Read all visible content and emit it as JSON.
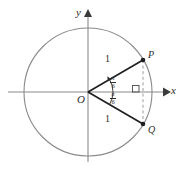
{
  "figure": {
    "type": "geometry-diagram",
    "axes": {
      "x_label": "x",
      "y_label": "y"
    },
    "origin_label": "O",
    "points": [
      {
        "name": "P",
        "label": "P",
        "position": "upper-right"
      },
      {
        "name": "Q",
        "label": "Q",
        "position": "lower-right"
      }
    ],
    "segment_lengths": [
      {
        "segment": "OP",
        "label": "1"
      },
      {
        "segment": "OQ",
        "label": "1"
      }
    ],
    "angles": [
      {
        "between": "OP-and-x-axis",
        "numerator": "π",
        "denominator": "6"
      },
      {
        "between": "OQ-and-x-axis",
        "numerator": "π",
        "denominator": "6"
      }
    ],
    "right_angle_marker": true,
    "colors": {
      "circle": "#8a8a8a",
      "axis": "#8a8a8a",
      "radius": "#1f1f1f",
      "dashed": "#9a9a9a",
      "text": "#2b2b2b"
    }
  }
}
